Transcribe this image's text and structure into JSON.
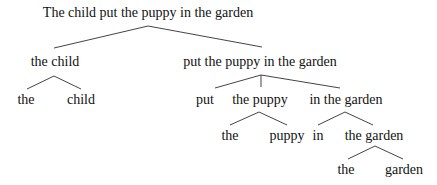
{
  "diagram": {
    "type": "parse-tree",
    "nodes": {
      "root": "The child put the puppy in the garden",
      "np_subject": "the child",
      "np_subject_det": "the",
      "np_subject_noun": "child",
      "vp": "put the puppy in the garden",
      "vp_verb": "put",
      "np_object": "the puppy",
      "np_object_det": "the",
      "np_object_noun": "puppy",
      "pp": "in the garden",
      "pp_prep": "in",
      "pp_np": "the garden",
      "pp_np_det": "the",
      "pp_np_noun": "garden"
    },
    "edges": [
      [
        "root",
        "np_subject"
      ],
      [
        "root",
        "vp"
      ],
      [
        "np_subject",
        "np_subject_det"
      ],
      [
        "np_subject",
        "np_subject_noun"
      ],
      [
        "vp",
        "vp_verb"
      ],
      [
        "vp",
        "np_object"
      ],
      [
        "vp",
        "pp"
      ],
      [
        "np_object",
        "np_object_det"
      ],
      [
        "np_object",
        "np_object_noun"
      ],
      [
        "pp",
        "pp_prep"
      ],
      [
        "pp",
        "pp_np"
      ],
      [
        "pp_np",
        "pp_np_det"
      ],
      [
        "pp_np",
        "pp_np_noun"
      ]
    ],
    "colors": {
      "text": "#111111",
      "line": "#444444",
      "background": "#ffffff"
    }
  }
}
